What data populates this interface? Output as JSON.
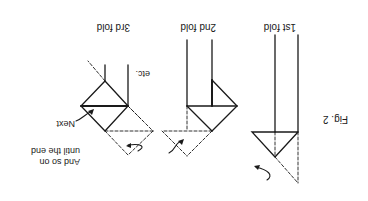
{
  "figure": {
    "caption": "Fig. 2",
    "orientation": "rotated 180 degrees",
    "panels": [
      {
        "id": "fold-1",
        "title": "1st fold"
      },
      {
        "id": "fold-2",
        "title": "2nd fold"
      },
      {
        "id": "fold-3",
        "title": "3rd fold"
      }
    ],
    "annotations": {
      "next": "Next",
      "etc": "etc.",
      "continue_line1": "And so on",
      "continue_line2": "until the end"
    },
    "colors": {
      "ink": "#1a1a1a",
      "background": "#ffffff"
    }
  }
}
